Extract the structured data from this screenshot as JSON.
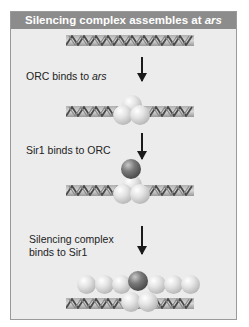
{
  "title": {
    "prefix": "Silencing complex assembles at ",
    "italic": "ars"
  },
  "steps": [
    {
      "label_prefix": "ORC binds to ",
      "label_italic": "ars"
    },
    {
      "label": "Sir1 binds to ORC"
    },
    {
      "label_line1": "Silencing complex",
      "label_line2": "binds to Sir1"
    }
  ],
  "colors": {
    "header_bg": "#8c8c8c",
    "panel_bg": "#ececec",
    "arrow": "#1a1a1a",
    "orc_protein": "#d8d8d8",
    "sir1_protein": "#5a5a5a",
    "silencing_complex_protein": "#d0d0d0"
  },
  "icons": {
    "dna": "dna-double-helix-icon",
    "arrow": "down-arrow-icon",
    "orc": "orc-protein-complex-icon",
    "sir1": "sir1-protein-icon"
  }
}
